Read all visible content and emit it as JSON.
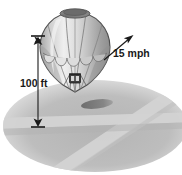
{
  "figure": {
    "kind": "illustration",
    "background_color": "#ffffff"
  },
  "annotations": {
    "altitude": {
      "label": "100 ft",
      "icon": "double-arrow-dimension-line",
      "orientation": "vertical"
    },
    "wind": {
      "label": "15 mph",
      "icon": "arrow-up-right-icon",
      "orientation": "up-right"
    }
  },
  "balloon": {
    "envelope_light": "#e8e8e8",
    "envelope_mid": "#c4c4c4",
    "envelope_dark": "#9a9a9a",
    "crown_color": "#7d7d7d",
    "outline_color": "#4a4a4a",
    "basket_color": "#3b3b3b",
    "scallop_color": "#d8d8d8"
  },
  "ground": {
    "field_color": "#b9b9b9",
    "field_edge_color": "#d2d2d2",
    "path_color": "#d4d4d4",
    "shadow_color": "#7c7c7c",
    "horizon_band_color": "#c9c9c9"
  },
  "line_color": "#1a1a1a"
}
